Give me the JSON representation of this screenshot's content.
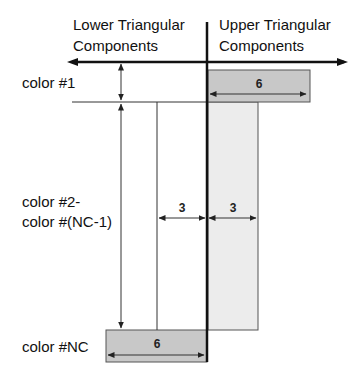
{
  "header": {
    "lower_line1": "Lower Triangular",
    "lower_line2": "Components",
    "upper_line1": "Upper Triangular",
    "upper_line2": "Components"
  },
  "rows": {
    "first": "color #1",
    "middle_line1": "color #2-",
    "middle_line2": "color #(NC-1)",
    "last": "color #NC"
  },
  "widths": {
    "first_upper": "6",
    "middle_lower": "3",
    "middle_upper": "3",
    "last_lower": "6"
  },
  "colors": {
    "dark_bar": "#c8c8c8",
    "light_bar": "#ececec",
    "axis": "#111111",
    "thin_line": "#333333"
  }
}
